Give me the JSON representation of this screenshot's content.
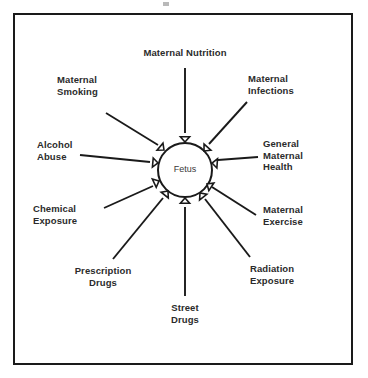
{
  "diagram": {
    "center": {
      "label": "Fetus",
      "shape": "circle"
    },
    "colors": {
      "background": "#ffffff",
      "border": "#1a1a1a",
      "line": "#1a1a1a",
      "text": "#2b2b2b",
      "center_text": "#3a3a3a",
      "arrow_fill": "#ffffff"
    },
    "arrow_style": "hollow-triangle-inward",
    "factors": [
      {
        "id": "maternal-nutrition",
        "label": "Maternal Nutrition",
        "position": "top",
        "align": "center"
      },
      {
        "id": "maternal-infections",
        "label": "Maternal\nInfections",
        "position": "top-right",
        "align": "left"
      },
      {
        "id": "general-maternal-health",
        "label": "General\nMaternal\nHealth",
        "position": "right",
        "align": "left"
      },
      {
        "id": "maternal-exercise",
        "label": "Maternal\nExercise",
        "position": "right-lower",
        "align": "left"
      },
      {
        "id": "radiation-exposure",
        "label": "Radiation\nExposure",
        "position": "bottom-right",
        "align": "left"
      },
      {
        "id": "street-drugs",
        "label": "Street\nDrugs",
        "position": "bottom",
        "align": "center"
      },
      {
        "id": "prescription-drugs",
        "label": "Prescription\nDrugs",
        "position": "bottom-left",
        "align": "center"
      },
      {
        "id": "chemical-exposure",
        "label": "Chemical\nExposure",
        "position": "left-lower",
        "align": "left"
      },
      {
        "id": "alcohol-abuse",
        "label": "Alcohol\nAbuse",
        "position": "left",
        "align": "left"
      },
      {
        "id": "maternal-smoking",
        "label": "Maternal\nSmoking",
        "position": "top-left",
        "align": "left"
      }
    ]
  }
}
